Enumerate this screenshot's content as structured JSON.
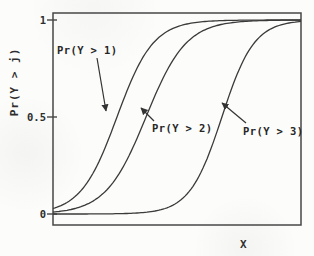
{
  "figure": {
    "background": "#fcfcfb",
    "ink": "#3a3a3a",
    "text_color": "#2e2e2e"
  },
  "chart_data": {
    "type": "line",
    "title": "",
    "xlabel": "X",
    "ylabel": "Pr(Y > j)",
    "x_range": [
      0,
      1
    ],
    "y_range": [
      0,
      1
    ],
    "grid": false,
    "legend_position": "none",
    "x_ticks": [],
    "y_ticks": [
      {
        "label": "1",
        "value": 1
      },
      {
        "label": "0.5",
        "value": 0.5
      },
      {
        "label": "0",
        "value": 0
      }
    ],
    "series": [
      {
        "name": "Pr(Y > 1)",
        "shape": "logistic",
        "midpoint": 0.258,
        "scale": 0.073
      },
      {
        "name": "Pr(Y > 2)",
        "shape": "logistic",
        "midpoint": 0.375,
        "scale": 0.081
      },
      {
        "name": "Pr(Y > 3)",
        "shape": "logistic",
        "midpoint": 0.681,
        "scale": 0.065
      }
    ],
    "annotations": [
      {
        "label": "Pr(Y > 1)",
        "label_left": 57,
        "label_top": 44,
        "arrow": {
          "x1": 97,
          "y1": 58,
          "x2": 106,
          "y2": 111
        }
      },
      {
        "label": "Pr(Y > 2)",
        "label_left": 152,
        "label_top": 122,
        "arrow": {
          "x1": 154,
          "y1": 121,
          "x2": 141,
          "y2": 108
        }
      },
      {
        "label": "Pr(Y > 3)",
        "label_left": 243,
        "label_top": 125,
        "arrow": {
          "x1": 246,
          "y1": 123,
          "x2": 222,
          "y2": 103
        }
      }
    ]
  }
}
